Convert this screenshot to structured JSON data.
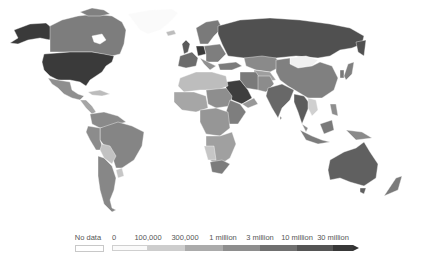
{
  "map": {
    "type": "choropleth",
    "palette": "grayscale",
    "regions": [
      {
        "name": "United States",
        "bin": "30 million+",
        "color": "#3a3a3a"
      },
      {
        "name": "Alaska (US)",
        "bin": "30 million+",
        "color": "#3a3a3a"
      },
      {
        "name": "Canada",
        "bin": "3-10 million",
        "color": "#7d7d7d"
      },
      {
        "name": "Greenland",
        "bin": "0",
        "color": "#ffffff"
      },
      {
        "name": "Mexico",
        "bin": "1-3 million",
        "color": "#8f8f8f"
      },
      {
        "name": "Brazil",
        "bin": "3-10 million",
        "color": "#858585"
      },
      {
        "name": "Argentina",
        "bin": "3-10 million",
        "color": "#878787"
      },
      {
        "name": "Bolivia",
        "bin": "100,000-300,000",
        "color": "#c2c2c2"
      },
      {
        "name": "Russia",
        "bin": "10-30 million",
        "color": "#505050"
      },
      {
        "name": "China",
        "bin": "3-10 million",
        "color": "#808080"
      },
      {
        "name": "Mongolia",
        "bin": "0",
        "color": "#f0f0f0"
      },
      {
        "name": "India",
        "bin": "10-30 million",
        "color": "#686868"
      },
      {
        "name": "Saudi Arabia",
        "bin": "30 million+",
        "color": "#3e3e3e"
      },
      {
        "name": "Australia",
        "bin": "10-30 million",
        "color": "#606060"
      },
      {
        "name": "Germany",
        "bin": "30 million+",
        "color": "#3a3a3a"
      },
      {
        "name": "Algeria",
        "bin": "100,000-300,000",
        "color": "#bdbdbd"
      },
      {
        "name": "Kazakhstan",
        "bin": "3-10 million",
        "color": "#8a8a8a"
      }
    ]
  },
  "legend": {
    "no_data_label": "No data",
    "labels": [
      "0",
      "100,000",
      "300,000",
      "1 million",
      "3 million",
      "10 million",
      "30 million"
    ],
    "label_positions": [
      114,
      148,
      185,
      223,
      260,
      297,
      333
    ],
    "colors": [
      "#f4f4f4",
      "#cfcfcf",
      "#adadad",
      "#8e8e8e",
      "#707070",
      "#545454",
      "#383838"
    ],
    "no_data_color": "#ffffff"
  }
}
